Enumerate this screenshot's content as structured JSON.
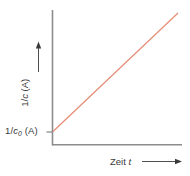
{
  "chart_data": {
    "type": "line",
    "title": "",
    "xlabel": "Zeit t",
    "ylabel": "1/c (A)",
    "intercept_label": "1/ c0 (A)",
    "series": [
      {
        "name": "1/c (A) vs Zeit t",
        "x": [
          0,
          1
        ],
        "values": [
          0.1,
          1.0
        ],
        "color": "#e58a72",
        "description": "straight rising line starting at intercept 1/c0"
      }
    ],
    "xlim": [
      0,
      1
    ],
    "ylim": [
      0,
      1
    ],
    "grid": false,
    "legend": null,
    "axis_color": "#8c8c8c",
    "annotations": [
      "y-axis tick at intercept 1/ c0 (A)",
      "arrow on y-axis label pointing up",
      "arrow on x-axis label pointing right"
    ]
  },
  "labels": {
    "intercept_prefix": "1/",
    "intercept_var": "c",
    "intercept_sub": "0",
    "intercept_unit": "(A)",
    "y_prefix": "1/",
    "y_var": "c",
    "y_unit": "(A)",
    "x_word": "Zeit",
    "x_var": "t"
  }
}
